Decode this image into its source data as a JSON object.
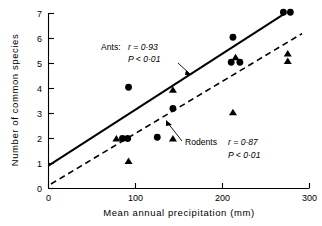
{
  "chart_data": {
    "type": "scatter",
    "title": "",
    "xlabel": "Mean annual precipitation (mm)",
    "ylabel": "Number of common species",
    "xlim": [
      0,
      300
    ],
    "ylim": [
      0,
      7
    ],
    "xticks": [
      0,
      100,
      200,
      300
    ],
    "xtick_labels": [
      "0",
      "100",
      "200",
      "300"
    ],
    "yticks": [
      0,
      1,
      2,
      3,
      4,
      5,
      6,
      7
    ],
    "ytick_labels": [
      "0",
      "1",
      "2",
      "3",
      "4",
      "5",
      "6",
      "7"
    ],
    "grid": false,
    "legend": "none",
    "series": [
      {
        "name": "Ants",
        "marker": "filled-circle",
        "points": [
          {
            "x": 85,
            "y": 2.0
          },
          {
            "x": 91,
            "y": 2.0
          },
          {
            "x": 92,
            "y": 4.05
          },
          {
            "x": 125,
            "y": 2.05
          },
          {
            "x": 143,
            "y": 3.2
          },
          {
            "x": 212,
            "y": 6.05
          },
          {
            "x": 210,
            "y": 5.05
          },
          {
            "x": 220,
            "y": 5.05
          },
          {
            "x": 270,
            "y": 7.05
          },
          {
            "x": 278,
            "y": 7.05
          }
        ],
        "fit_line": {
          "style": "solid",
          "x_start": 0,
          "y_start": 0.92,
          "x_end": 272,
          "y_end": 7.05
        },
        "annotation": {
          "label": "Ants:",
          "r_text": "r = 0·93",
          "p_text": "P < 0·01"
        }
      },
      {
        "name": "Rodents",
        "marker": "filled-triangle",
        "points": [
          {
            "x": 78,
            "y": 2.0
          },
          {
            "x": 92,
            "y": 1.1
          },
          {
            "x": 143,
            "y": 3.95
          },
          {
            "x": 143,
            "y": 2.0
          },
          {
            "x": 212,
            "y": 3.05
          },
          {
            "x": 215,
            "y": 5.25
          },
          {
            "x": 275,
            "y": 5.4
          },
          {
            "x": 275,
            "y": 5.1
          }
        ],
        "fit_line": {
          "style": "dashed",
          "x_start": 3,
          "y_start": 0.18,
          "x_end": 292,
          "y_end": 6.25
        },
        "annotation": {
          "label": "Rodents",
          "r_text": "r = 0·87",
          "p_text": "P < 0·01"
        }
      }
    ]
  },
  "axes": {
    "x_title": "Mean annual precipitation (mm)",
    "y_title": "Number of common species",
    "x_ticks": [
      "0",
      "100",
      "200",
      "300"
    ],
    "y_ticks": [
      "7",
      "6",
      "5",
      "4",
      "3",
      "2",
      "1",
      "0"
    ]
  },
  "annotations": {
    "ants_label": "Ants:",
    "ants_r": "r = 0·93",
    "ants_p": "P < 0·01",
    "rodents_label": "Rodents",
    "rodents_r": "r = 0·87",
    "rodents_p": "P < 0·01"
  },
  "colors": {
    "ink": "#000000",
    "background": "#ffffff"
  }
}
